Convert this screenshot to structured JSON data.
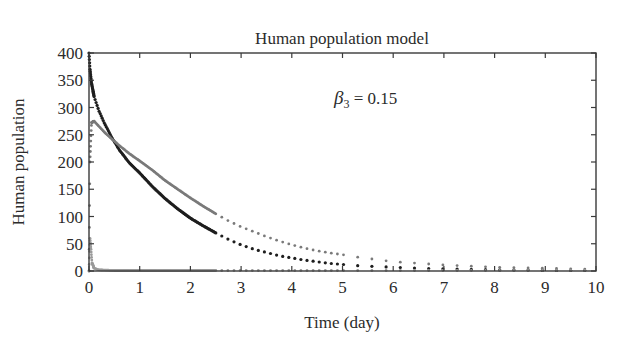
{
  "chart_data": {
    "type": "scatter",
    "title": "Human population model",
    "xlabel": "Time (day)",
    "ylabel": "Human population",
    "xlim": [
      0,
      10
    ],
    "ylim": [
      0,
      400
    ],
    "xticks": [
      0,
      1,
      2,
      3,
      4,
      5,
      6,
      7,
      8,
      9,
      10
    ],
    "yticks": [
      0,
      50,
      100,
      150,
      200,
      250,
      300,
      350,
      400
    ],
    "grid": false,
    "legend": null,
    "annotations": [
      {
        "text": "β3 = 0.15",
        "symbol": "β",
        "subscript": "3",
        "rest": " = 0.15",
        "x": 5.0,
        "y": 320
      }
    ],
    "series": [
      {
        "name": "black curve (susceptible humans)",
        "color": "#1e1e1e",
        "points": [
          [
            0,
            400
          ],
          [
            0.02,
            370
          ],
          [
            0.05,
            345
          ],
          [
            0.1,
            320
          ],
          [
            0.2,
            293
          ],
          [
            0.3,
            272
          ],
          [
            0.45,
            245
          ],
          [
            0.6,
            222
          ],
          [
            0.8,
            198
          ],
          [
            1.0,
            180
          ],
          [
            1.25,
            155
          ],
          [
            1.5,
            133
          ],
          [
            1.75,
            114
          ],
          [
            2.0,
            97
          ],
          [
            2.25,
            83
          ],
          [
            2.5,
            70
          ],
          [
            2.75,
            58
          ],
          [
            3.0,
            48
          ],
          [
            3.25,
            40
          ],
          [
            3.5,
            34
          ],
          [
            3.75,
            28
          ],
          [
            4.0,
            24
          ],
          [
            4.25,
            20
          ],
          [
            4.5,
            17
          ],
          [
            4.75,
            14
          ],
          [
            5.0,
            12
          ],
          [
            5.25,
            10
          ],
          [
            5.5,
            9
          ],
          [
            5.75,
            8
          ],
          [
            6.0,
            7
          ],
          [
            6.5,
            5
          ],
          [
            7.0,
            4
          ],
          [
            7.5,
            3
          ],
          [
            8.0,
            2
          ],
          [
            8.5,
            2
          ],
          [
            9.0,
            1
          ],
          [
            9.5,
            1
          ],
          [
            10.0,
            1
          ]
        ]
      },
      {
        "name": "gray curve (infected humans)",
        "color": "#7a7a7a",
        "points": [
          [
            0,
            0
          ],
          [
            0.02,
            200
          ],
          [
            0.05,
            272
          ],
          [
            0.1,
            275
          ],
          [
            0.2,
            265
          ],
          [
            0.3,
            255
          ],
          [
            0.45,
            242
          ],
          [
            0.6,
            230
          ],
          [
            0.8,
            215
          ],
          [
            1.0,
            202
          ],
          [
            1.25,
            185
          ],
          [
            1.5,
            166
          ],
          [
            1.75,
            150
          ],
          [
            2.0,
            134
          ],
          [
            2.25,
            119
          ],
          [
            2.5,
            105
          ],
          [
            2.75,
            92
          ],
          [
            3.0,
            81
          ],
          [
            3.25,
            72
          ],
          [
            3.5,
            63
          ],
          [
            3.75,
            55
          ],
          [
            4.0,
            48
          ],
          [
            4.25,
            42
          ],
          [
            4.5,
            37
          ],
          [
            4.75,
            33
          ],
          [
            5.0,
            30
          ],
          [
            5.25,
            26
          ],
          [
            5.5,
            23
          ],
          [
            5.75,
            20
          ],
          [
            6.0,
            17
          ],
          [
            6.5,
            14
          ],
          [
            7.0,
            11
          ],
          [
            7.5,
            9
          ],
          [
            8.0,
            7
          ],
          [
            8.5,
            6
          ],
          [
            9.0,
            5
          ],
          [
            9.5,
            4
          ],
          [
            10.0,
            3
          ]
        ]
      },
      {
        "name": "light gray curve (recovered/other humans)",
        "color": "#9a9a9a",
        "points": [
          [
            0,
            0
          ],
          [
            0.02,
            60
          ],
          [
            0.04,
            40
          ],
          [
            0.06,
            15
          ],
          [
            0.1,
            5
          ],
          [
            0.2,
            2
          ],
          [
            0.5,
            1
          ],
          [
            1.0,
            1
          ],
          [
            2.0,
            1
          ],
          [
            3.0,
            1
          ],
          [
            4.0,
            1
          ],
          [
            5.0,
            1
          ],
          [
            6.0,
            1
          ],
          [
            7.0,
            1
          ],
          [
            8.0,
            1
          ],
          [
            9.0,
            1
          ],
          [
            10.0,
            1
          ]
        ]
      }
    ]
  },
  "layout": {
    "plot_left": 89,
    "plot_right": 596,
    "plot_top": 53,
    "plot_bottom": 271
  }
}
